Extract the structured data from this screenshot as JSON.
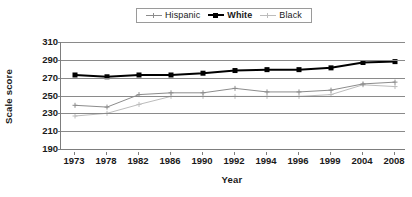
{
  "chart_data": {
    "type": "line",
    "title": "",
    "xlabel": "Year",
    "ylabel": "Scale score",
    "categories": [
      "1973",
      "1978",
      "1982",
      "1986",
      "1990",
      "1992",
      "1994",
      "1996",
      "1999",
      "2004",
      "2008"
    ],
    "ylim": [
      190,
      310
    ],
    "yticks": [
      190,
      210,
      230,
      250,
      270,
      290,
      310
    ],
    "grid": true,
    "legend_position": "top-center",
    "series": [
      {
        "name": "Hispanic",
        "color": "#8c8c8c",
        "marker": "cross",
        "values": [
          239,
          237,
          251,
          253,
          253,
          258,
          254,
          254,
          256,
          263,
          265
        ]
      },
      {
        "name": "White",
        "color": "#000000",
        "marker": "square",
        "values": [
          273,
          271,
          273,
          273,
          275,
          278,
          279,
          279,
          281,
          287,
          288
        ]
      },
      {
        "name": "Black",
        "color": "#bcbcbc",
        "marker": "cross",
        "values": [
          227,
          230,
          240,
          249,
          249,
          249,
          249,
          249,
          251,
          262,
          260
        ]
      }
    ]
  },
  "legend": {
    "entries": [
      {
        "label": "Hispanic"
      },
      {
        "label": "White"
      },
      {
        "label": "Black"
      }
    ]
  }
}
